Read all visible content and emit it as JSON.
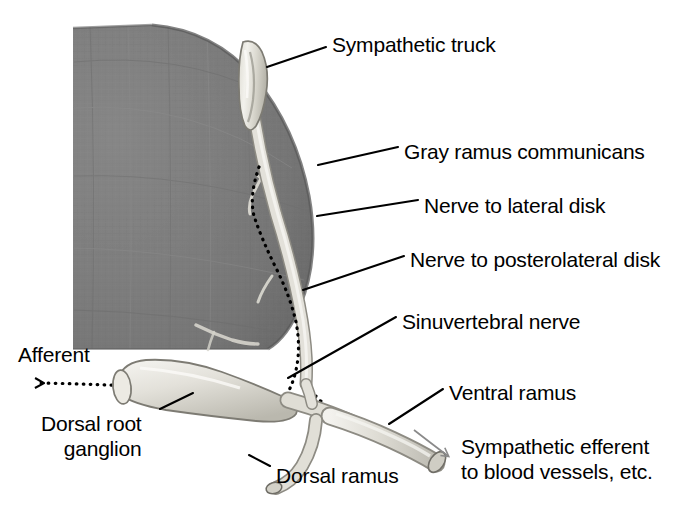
{
  "figure": {
    "type": "anatomical-diagram",
    "background_color": "#ffffff",
    "ink_color": "#000000"
  },
  "colors": {
    "vertebral_body_dark": "#7d7d7d",
    "vertebral_body_dark_edge": "#5e5e5e",
    "nerve_pale": "#d7d5ce",
    "nerve_pale_light": "#eceae4",
    "nerve_outline": "#6b6b6b",
    "leader_line": "#000000",
    "dotted_pathway": "#000000",
    "efferent_arrow": "#8a8a8a"
  },
  "labels": [
    {
      "id": "sympathetic-truck",
      "text": "Sympathetic truck",
      "x": 332,
      "y": 32,
      "lines": 1
    },
    {
      "id": "gray-ramus-communicans",
      "text": "Gray ramus communicans",
      "x": 404,
      "y": 139,
      "lines": 1
    },
    {
      "id": "nerve-to-lateral-disk",
      "text": "Nerve to lateral disk",
      "x": 424,
      "y": 193,
      "lines": 1
    },
    {
      "id": "nerve-to-posterolateral-disk",
      "text": "Nerve to posterolateral disk",
      "x": 410,
      "y": 247,
      "lines": 1
    },
    {
      "id": "sinuvertebral-nerve",
      "text": "Sinuvertebral nerve",
      "x": 402,
      "y": 309,
      "lines": 1
    },
    {
      "id": "ventral-ramus",
      "text": "Ventral ramus",
      "x": 449,
      "y": 380,
      "lines": 1
    },
    {
      "id": "afferent",
      "text": "Afferent",
      "x": 18,
      "y": 342,
      "lines": 1
    },
    {
      "id": "dorsal-root-ganglion",
      "text": "Dorsal root\nganglion",
      "x": 41,
      "y": 411,
      "lines": 2
    },
    {
      "id": "dorsal-ramus",
      "text": "Dorsal ramus",
      "x": 276,
      "y": 463,
      "lines": 1
    },
    {
      "id": "sympathetic-efferent",
      "text": "Sympathetic efferent\nto blood vessels, etc.",
      "x": 461,
      "y": 434,
      "lines": 2
    }
  ],
  "leader_lines": [
    {
      "id": "leader-sympathetic-truck",
      "from": [
        326,
        47
      ],
      "to": [
        267,
        67
      ]
    },
    {
      "id": "leader-gray-ramus",
      "from": [
        398,
        147
      ],
      "to": [
        318,
        165
      ]
    },
    {
      "id": "leader-nerve-lateral-disk",
      "from": [
        418,
        200
      ],
      "to": [
        317,
        216
      ]
    },
    {
      "id": "leader-nerve-posterolateral-disk",
      "from": [
        404,
        256
      ],
      "to": [
        303,
        290
      ]
    },
    {
      "id": "leader-sinuvertebral-nerve",
      "from": [
        396,
        317
      ],
      "to": [
        288,
        378
      ]
    },
    {
      "id": "leader-ventral-ramus",
      "from": [
        443,
        389
      ],
      "to": [
        389,
        424
      ]
    },
    {
      "id": "leader-dorsal-root-ganglion",
      "from": [
        160,
        409
      ],
      "to": [
        193,
        393
      ]
    },
    {
      "id": "leader-dorsal-ramus",
      "from": [
        270,
        466
      ],
      "to": [
        249,
        455
      ]
    }
  ],
  "arrows": [
    {
      "id": "afferent-arrow",
      "style": "dotted",
      "direction": "left",
      "from": [
        321,
        401
      ],
      "to": [
        30,
        383
      ]
    },
    {
      "id": "sympathetic-efferent-arrow",
      "style": "solid-thin",
      "direction": "down-right",
      "from": [
        415,
        430
      ],
      "to": [
        455,
        461
      ]
    }
  ],
  "structures": [
    {
      "id": "vertebral-body",
      "name": "vertebral body and disk",
      "shading": "dark-gray-textured"
    },
    {
      "id": "sympathetic-trunk-ganglion",
      "name": "sympathetic trunk ganglion",
      "shading": "pale"
    },
    {
      "id": "gray-ramus",
      "name": "gray ramus communicans",
      "shading": "pale"
    },
    {
      "id": "dorsal-root-ganglion-body",
      "name": "dorsal root ganglion",
      "shading": "pale-bulb"
    },
    {
      "id": "spinal-nerve",
      "name": "spinal nerve",
      "shading": "pale"
    },
    {
      "id": "ventral-ramus-body",
      "name": "ventral ramus",
      "shading": "pale-tube-cut-end"
    },
    {
      "id": "dorsal-ramus-body",
      "name": "dorsal ramus",
      "shading": "pale-tube-cut-end"
    },
    {
      "id": "sinuvertebral-nerve-path",
      "name": "sinuvertebral nerve",
      "shading": "dotted-path"
    }
  ]
}
